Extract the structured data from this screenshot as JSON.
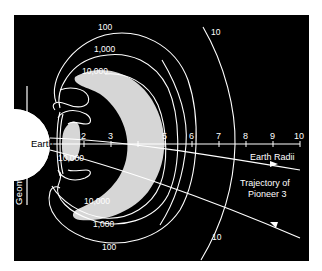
{
  "colors": {
    "background": "#ffffff",
    "panel": "#000000",
    "earth": "#ffffff",
    "belt": "#d6d6d6",
    "lines": "#ffffff"
  },
  "labels": {
    "earth": "Earth",
    "geomagnetic_axis": "Geomagnetic Axis",
    "earth_radii": "Earth Radii",
    "trajectory_line1": "Trajectory of",
    "trajectory_line2": "Pioneer 3"
  },
  "axis": {
    "ticks": [
      "2",
      "3",
      "4",
      "5",
      "6",
      "7",
      "8",
      "9",
      "10"
    ]
  },
  "contours": {
    "top": [
      "100",
      "1,000",
      "10,000"
    ],
    "bottom": [
      "10,000",
      "1,000",
      "100"
    ],
    "inner": "10,000",
    "outer_top": "10",
    "outer_bottom": "10"
  }
}
